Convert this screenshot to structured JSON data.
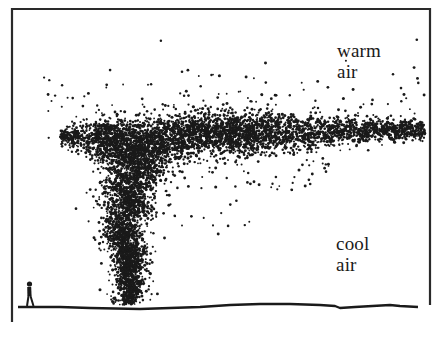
{
  "figure": {
    "type": "illustration",
    "colors": {
      "background": "#ffffff",
      "ink": "#1a1a1a",
      "frame": "#2a2a2a"
    }
  },
  "labels": {
    "warm_air": {
      "line1": "warm",
      "line2": "air"
    },
    "cool_air": {
      "line1": "cool",
      "line2": "air"
    }
  },
  "frame": {
    "left_x": 12,
    "top_y": 9,
    "right_x": 430,
    "left_bottom_y": 322,
    "right_bottom_y": 305
  },
  "ground": {
    "points": [
      [
        18,
        307
      ],
      [
        60,
        307
      ],
      [
        90,
        308
      ],
      [
        140,
        309
      ],
      [
        170,
        308
      ],
      [
        200,
        307
      ],
      [
        230,
        305
      ],
      [
        260,
        304
      ],
      [
        290,
        304
      ],
      [
        320,
        305
      ],
      [
        335,
        306
      ],
      [
        340,
        308
      ],
      [
        355,
        307
      ],
      [
        390,
        305
      ],
      [
        400,
        306
      ],
      [
        418,
        307
      ]
    ]
  },
  "person": {
    "x": 29,
    "base_y": 307,
    "height": 26
  },
  "plume": {
    "seed": 7,
    "column": {
      "base_x": 125,
      "base_y": 305,
      "top_y": 150,
      "base_half_width": 10,
      "top_half_width": 30,
      "dots": 2600
    },
    "spread_layer": {
      "left_x": 60,
      "right_x": 425,
      "center_y": 140,
      "core_left_x": 95,
      "core_right_x": 250,
      "thickness_core": 26,
      "thickness_tip": 10,
      "dots": 4200
    },
    "scatter_dots": 260,
    "dot_radius": 1.15
  }
}
